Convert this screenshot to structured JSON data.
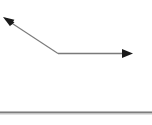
{
  "canvas": {
    "width": 152,
    "height": 125,
    "background_color": "#ffffff"
  },
  "diagram": {
    "title": "",
    "colors": {
      "line_stroke": "#7a7a7a",
      "arrowhead_fill": "#1a1a1a",
      "baseline_stroke": "#808080"
    },
    "elements": [
      {
        "name": "incident-ray",
        "type": "segment",
        "from": [
          10,
          22
        ],
        "to": [
          58,
          53.5
        ],
        "stroke": "#7a7a7a",
        "stroke_width": 1.1,
        "arrow_at": "from"
      },
      {
        "name": "horizontal-ray",
        "type": "segment",
        "from": [
          58,
          53.5
        ],
        "to": [
          123,
          53.5
        ],
        "stroke": "#7a7a7a",
        "stroke_width": 1.4,
        "arrow_at": "to"
      },
      {
        "name": "upper-left-arrowhead",
        "type": "arrowhead",
        "tip": [
          3,
          17
        ],
        "direction_deg": 213,
        "length": 11,
        "half_width": 4,
        "fill": "#1a1a1a"
      },
      {
        "name": "right-arrowhead",
        "type": "arrowhead",
        "tip": [
          133,
          53.5
        ],
        "direction_deg": 0,
        "length": 11,
        "half_width": 4.5,
        "fill": "#1a1a1a"
      },
      {
        "name": "baseline",
        "type": "segment",
        "from": [
          0,
          112.5
        ],
        "to": [
          152,
          112.5
        ],
        "stroke": "#808080",
        "stroke_width": 2.2,
        "arrow_at": "none"
      }
    ],
    "vertex": {
      "name": "reflection-point",
      "position": [
        58,
        53.5
      ]
    }
  },
  "labels": []
}
